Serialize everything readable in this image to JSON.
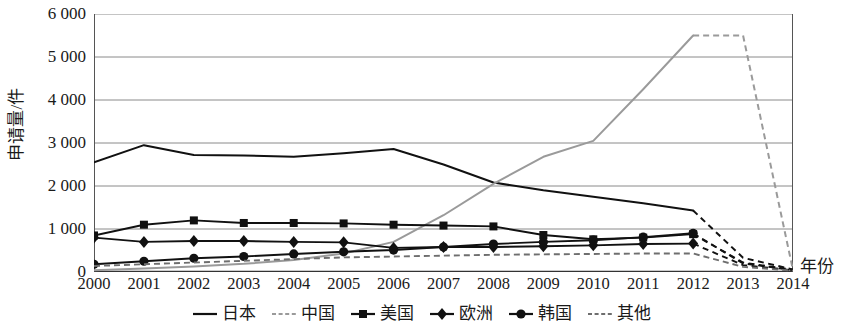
{
  "chart_data": {
    "type": "line",
    "title": "",
    "subtitle": "",
    "xlabel": "年份",
    "ylabel": "申请量/件",
    "x": [
      2000,
      2001,
      2002,
      2003,
      2004,
      2005,
      2006,
      2007,
      2008,
      2009,
      2010,
      2011,
      2012,
      2013,
      2014
    ],
    "xtick_labels": [
      "2000",
      "2001",
      "2002",
      "2003",
      "2004",
      "2005",
      "2006",
      "2007",
      "2008",
      "2009",
      "2010",
      "2011",
      "2012",
      "2013",
      "2014"
    ],
    "ytick_labels": [
      "6 000",
      "5 000",
      "4 000",
      "3 000",
      "2 000",
      "1 000",
      "0"
    ],
    "ytick_values": [
      6000,
      5000,
      4000,
      3000,
      2000,
      1000,
      0
    ],
    "ylim": [
      0,
      6000
    ],
    "xlim": [
      2000,
      2014
    ],
    "grid": "horizontal",
    "legend_position": "bottom",
    "note": "Solid segments are observed data through 2012; dashed segments after 2012 indicate incomplete/projected data declining toward zero.",
    "series": [
      {
        "name": "日本",
        "color": "#111111",
        "marker": "none",
        "line": "solid",
        "dash_from_index": 12,
        "values": [
          2550,
          2950,
          2720,
          2710,
          2680,
          2760,
          2860,
          2500,
          2080,
          1900,
          1750,
          1600,
          1430,
          330,
          60
        ]
      },
      {
        "name": "中国",
        "color": "#9a9a9a",
        "marker": "none",
        "line": "solid",
        "dash_from_index": 12,
        "values": [
          40,
          80,
          130,
          190,
          280,
          430,
          700,
          1320,
          2050,
          2680,
          3050,
          4250,
          5500,
          5500,
          40
        ]
      },
      {
        "name": "美国",
        "color": "#111111",
        "marker": "square",
        "line": "solid",
        "dash_from_index": 12,
        "values": [
          850,
          1100,
          1200,
          1140,
          1140,
          1130,
          1100,
          1080,
          1060,
          860,
          760,
          800,
          880,
          220,
          50
        ]
      },
      {
        "name": "欧洲",
        "color": "#111111",
        "marker": "diamond",
        "line": "solid",
        "dash_from_index": 12,
        "values": [
          800,
          700,
          720,
          720,
          700,
          690,
          560,
          580,
          580,
          600,
          620,
          650,
          660,
          160,
          40
        ]
      },
      {
        "name": "韩国",
        "color": "#111111",
        "marker": "circle",
        "line": "solid",
        "dash_from_index": 12,
        "values": [
          180,
          250,
          320,
          360,
          420,
          470,
          510,
          580,
          650,
          700,
          740,
          810,
          900,
          200,
          45
        ]
      },
      {
        "name": "其他",
        "color": "#6e6e6e",
        "marker": "none",
        "line": "dashed",
        "dash_from_index": 0,
        "values": [
          140,
          180,
          220,
          260,
          300,
          340,
          360,
          380,
          400,
          410,
          420,
          430,
          430,
          120,
          30
        ]
      }
    ]
  },
  "legend": {
    "items": [
      {
        "label": "日本",
        "marker": "none",
        "line": "solid",
        "color": "#111111"
      },
      {
        "label": "中国",
        "marker": "none",
        "line": "dashed",
        "color": "#9a9a9a"
      },
      {
        "label": "美国",
        "marker": "square",
        "line": "solid",
        "color": "#111111"
      },
      {
        "label": "欧洲",
        "marker": "diamond",
        "line": "solid",
        "color": "#111111"
      },
      {
        "label": "韩国",
        "marker": "circle",
        "line": "solid",
        "color": "#111111"
      },
      {
        "label": "其他",
        "marker": "none",
        "line": "dashed",
        "color": "#6e6e6e"
      }
    ]
  },
  "axes": {
    "y_axis_title": "申请量/件",
    "x_axis_title": "年份"
  },
  "style": {
    "grid_color": "#8a8a8a",
    "frame_color": "#555555",
    "background": "#ffffff"
  }
}
